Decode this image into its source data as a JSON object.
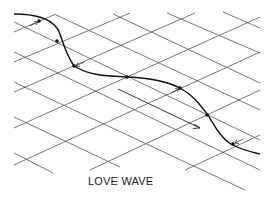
{
  "diagram": {
    "caption": "LOVE WAVE",
    "elements": {
      "grid": "surface-grid",
      "wave_curve": "particle-displacement-curve",
      "propagation_arrow": "propagation-direction-arrow",
      "motion_arrows": "particle-motion-arrows"
    },
    "colors": {
      "grid": "#555555",
      "curve": "#111111",
      "text": "#222222"
    }
  }
}
